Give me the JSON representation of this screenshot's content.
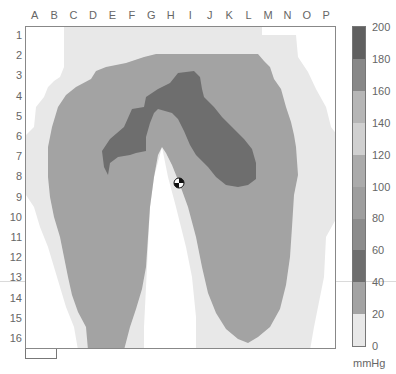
{
  "chart_data": {
    "type": "heatmap",
    "title": "",
    "x_tick_labels": [
      "A",
      "B",
      "C",
      "D",
      "E",
      "F",
      "G",
      "H",
      "I",
      "J",
      "K",
      "L",
      "M",
      "N",
      "O",
      "P"
    ],
    "y_tick_labels": [
      "1",
      "2",
      "3",
      "4",
      "5",
      "6",
      "7",
      "8",
      "9",
      "10",
      "11",
      "12",
      "13",
      "14",
      "15",
      "16"
    ],
    "colorbar": {
      "unit": "mmHg",
      "range": [
        0,
        200
      ],
      "ticks": [
        0,
        20,
        40,
        60,
        80,
        100,
        120,
        140,
        160,
        180,
        200
      ],
      "levels": [
        {
          "from": 0,
          "to": 20,
          "color": "#e8e8e8"
        },
        {
          "from": 20,
          "to": 40,
          "color": "#a3a3a3"
        },
        {
          "from": 40,
          "to": 60,
          "color": "#6e6e6e"
        },
        {
          "from": 60,
          "to": 80,
          "color": "#8c8c8c"
        },
        {
          "from": 80,
          "to": 100,
          "color": "#9e9e9e"
        },
        {
          "from": 100,
          "to": 120,
          "color": "#ababab"
        },
        {
          "from": 120,
          "to": 140,
          "color": "#d0d0d0"
        },
        {
          "from": 140,
          "to": 160,
          "color": "#b6b6b6"
        },
        {
          "from": 160,
          "to": 180,
          "color": "#888888"
        },
        {
          "from": 180,
          "to": 200,
          "color": "#606060"
        }
      ]
    },
    "regions": [
      {
        "level": "0-20 mmHg",
        "description": "outer contact area, rows 1-16 across columns B-O"
      },
      {
        "level": "20-40 mmHg",
        "description": "two thigh-shaped lobes from row 2 to row 16"
      },
      {
        "level": "40-60 mmHg",
        "description": "upper peak band rows 3-8, columns E-L"
      }
    ],
    "marker": {
      "label": "center of pressure",
      "approx_cell": "H8"
    },
    "grid": false,
    "legend_position": "right"
  },
  "colors": {
    "background": "#ffffff",
    "level_low": "#e8e8e8",
    "level_mid": "#a3a3a3",
    "level_high": "#6e6e6e",
    "frame": "#888888"
  }
}
